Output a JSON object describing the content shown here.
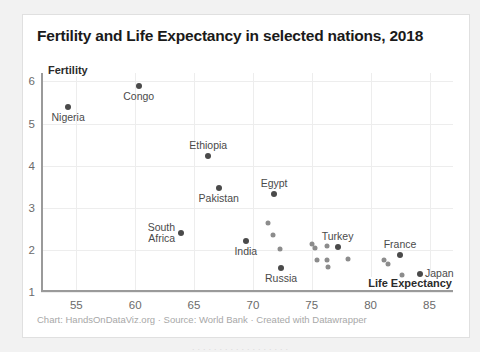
{
  "card": {
    "title": "Fertility and Life Expectancy in selected nations, 2018",
    "footer": "Chart: HandsOnDataViz.org · Source: World Bank · Created with Datawrapper",
    "bottom_clipped_text": "· · · · · · · · · · · · · · · · · ·"
  },
  "chart_data": {
    "type": "scatter",
    "title": "Fertility and Life Expectancy in selected nations, 2018",
    "xlabel": "Life Expectancy",
    "ylabel": "Fertility",
    "xlim": [
      52.0,
      87.0
    ],
    "ylim": [
      1.0,
      6.2
    ],
    "xticks": [
      55,
      60,
      65,
      70,
      75,
      80,
      85
    ],
    "yticks": [
      1,
      2,
      3,
      4,
      5,
      6
    ],
    "xtick_labels": [
      "55",
      "60",
      "65",
      "70",
      "75",
      "80",
      "85"
    ],
    "ytick_labels": [
      "1",
      "2",
      "3",
      "4",
      "5",
      "6"
    ],
    "grid": true,
    "legend": false,
    "marker_color": "#4a4a4a",
    "marker_color_unlabeled": "#8c8c8c",
    "source": "World Bank",
    "points": [
      {
        "name": "Nigeria",
        "x": 54.3,
        "y": 5.39,
        "labeled": true,
        "label_pos": "below"
      },
      {
        "name": "Congo",
        "x": 60.3,
        "y": 5.9,
        "labeled": true,
        "label_pos": "below"
      },
      {
        "name": "Ethiopia",
        "x": 66.2,
        "y": 4.24,
        "labeled": true,
        "label_pos": "above"
      },
      {
        "name": "Pakistan",
        "x": 67.1,
        "y": 3.48,
        "labeled": true,
        "label_pos": "below"
      },
      {
        "name": "Egypt",
        "x": 71.8,
        "y": 3.34,
        "labeled": true,
        "label_pos": "above"
      },
      {
        "name": "South Africa",
        "x": 63.9,
        "y": 2.4,
        "labeled": true,
        "label_pos": "left"
      },
      {
        "name": "India",
        "x": 69.4,
        "y": 2.22,
        "labeled": true,
        "label_pos": "below"
      },
      {
        "name": "Russia",
        "x": 72.4,
        "y": 1.58,
        "labeled": true,
        "label_pos": "below"
      },
      {
        "name": "Turkey",
        "x": 77.2,
        "y": 2.07,
        "labeled": true,
        "label_pos": "above"
      },
      {
        "name": "France",
        "x": 82.5,
        "y": 1.88,
        "labeled": true,
        "label_pos": "above"
      },
      {
        "name": "Japan",
        "x": 84.2,
        "y": 1.42,
        "labeled": true,
        "label_pos": "right"
      },
      {
        "name": "",
        "x": 71.3,
        "y": 2.65,
        "labeled": false,
        "label_pos": ""
      },
      {
        "name": "",
        "x": 71.7,
        "y": 2.36,
        "labeled": false,
        "label_pos": ""
      },
      {
        "name": "",
        "x": 72.3,
        "y": 2.02,
        "labeled": false,
        "label_pos": ""
      },
      {
        "name": "",
        "x": 75.0,
        "y": 2.14,
        "labeled": false,
        "label_pos": ""
      },
      {
        "name": "",
        "x": 75.3,
        "y": 2.05,
        "labeled": false,
        "label_pos": ""
      },
      {
        "name": "",
        "x": 76.3,
        "y": 2.09,
        "labeled": false,
        "label_pos": ""
      },
      {
        "name": "",
        "x": 75.4,
        "y": 1.77,
        "labeled": false,
        "label_pos": ""
      },
      {
        "name": "",
        "x": 76.3,
        "y": 1.77,
        "labeled": false,
        "label_pos": ""
      },
      {
        "name": "",
        "x": 76.4,
        "y": 1.6,
        "labeled": false,
        "label_pos": ""
      },
      {
        "name": "",
        "x": 78.1,
        "y": 1.78,
        "labeled": false,
        "label_pos": ""
      },
      {
        "name": "",
        "x": 81.1,
        "y": 1.76,
        "labeled": false,
        "label_pos": ""
      },
      {
        "name": "",
        "x": 81.5,
        "y": 1.66,
        "labeled": false,
        "label_pos": ""
      },
      {
        "name": "",
        "x": 82.7,
        "y": 1.4,
        "labeled": false,
        "label_pos": ""
      }
    ]
  }
}
